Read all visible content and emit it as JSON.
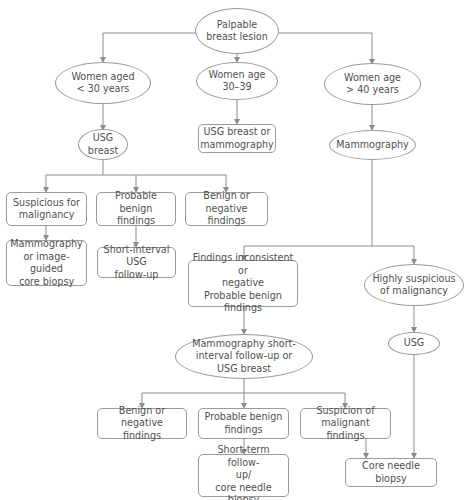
{
  "diagram": {
    "type": "flowchart",
    "colors": {
      "stroke": "#8c8c8c",
      "text": "#505050",
      "background": "#ffffff"
    },
    "nodes": {
      "root": {
        "shape": "ellipse",
        "label": "Palpable\nbreast lesion"
      },
      "age_under_30": {
        "shape": "ellipse",
        "label": "Women aged\n< 30 years"
      },
      "age_30_39": {
        "shape": "ellipse",
        "label": "Women age\n30–39"
      },
      "age_over_40": {
        "shape": "ellipse",
        "label": "Women age\n> 40 years"
      },
      "usg_breast": {
        "shape": "ellipse",
        "label": "USG\nbreast"
      },
      "usg_or_mammo": {
        "shape": "box",
        "label": "USG breast or\nmammography"
      },
      "mammography": {
        "shape": "ellipse",
        "label": "Mammography"
      },
      "suspicious_malignancy": {
        "shape": "box",
        "label": "Suspicious for\nmalignancy"
      },
      "probable_benign_1": {
        "shape": "box",
        "label": "Probable benign\nfindings"
      },
      "benign_negative_1": {
        "shape": "box",
        "label": "Benign or negative\nfindings"
      },
      "mammo_or_core_biopsy": {
        "shape": "box",
        "label": "Mammography\nor image-guided\ncore biopsy"
      },
      "short_interval_usg": {
        "shape": "box",
        "label": "Short-interval USG\nfollow-up"
      },
      "findings_inconsistent": {
        "shape": "box",
        "label": "Findings inconsistent or\nnegative\nProbable benign findings"
      },
      "highly_suspicious": {
        "shape": "ellipse",
        "label": "Highly suspicious\nof malignancy"
      },
      "mammo_short_interval": {
        "shape": "ellipse",
        "label": "Mammography short-\ninterval follow-up or\nUSG breast"
      },
      "usg": {
        "shape": "ellipse",
        "label": "USG"
      },
      "benign_negative_2": {
        "shape": "box",
        "label": "Benign or\nnegative findings"
      },
      "probable_benign_2": {
        "shape": "box",
        "label": "Probable benign\nfindings"
      },
      "suspicion_malignant": {
        "shape": "box",
        "label": "Suspicion of\nmalignant findings"
      },
      "short_term_followup": {
        "shape": "box",
        "label": "Short-term follow-\nup/\ncore needle biopsy"
      },
      "core_needle_biopsy": {
        "shape": "box",
        "label": "Core needle biopsy"
      }
    },
    "edges": [
      [
        "root",
        "age_under_30"
      ],
      [
        "root",
        "age_30_39"
      ],
      [
        "root",
        "age_over_40"
      ],
      [
        "age_under_30",
        "usg_breast"
      ],
      [
        "age_30_39",
        "usg_or_mammo"
      ],
      [
        "age_over_40",
        "mammography"
      ],
      [
        "usg_breast",
        "suspicious_malignancy"
      ],
      [
        "usg_breast",
        "probable_benign_1"
      ],
      [
        "usg_breast",
        "benign_negative_1"
      ],
      [
        "suspicious_malignancy",
        "mammo_or_core_biopsy"
      ],
      [
        "probable_benign_1",
        "short_interval_usg"
      ],
      [
        "mammography",
        "findings_inconsistent"
      ],
      [
        "mammography",
        "highly_suspicious"
      ],
      [
        "findings_inconsistent",
        "mammo_short_interval"
      ],
      [
        "highly_suspicious",
        "usg"
      ],
      [
        "mammo_short_interval",
        "benign_negative_2"
      ],
      [
        "mammo_short_interval",
        "probable_benign_2"
      ],
      [
        "mammo_short_interval",
        "suspicion_malignant"
      ],
      [
        "probable_benign_2",
        "short_term_followup"
      ],
      [
        "suspicion_malignant",
        "core_needle_biopsy"
      ],
      [
        "usg",
        "core_needle_biopsy"
      ]
    ]
  }
}
